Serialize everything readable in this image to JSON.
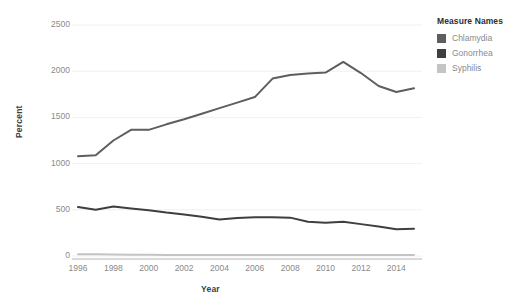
{
  "chart_data": {
    "type": "line",
    "title": "",
    "xlabel": "Year",
    "ylabel": "Percent",
    "xlim": [
      1996,
      2015
    ],
    "ylim": [
      0,
      2500
    ],
    "grid": true,
    "legend_position": "right",
    "legend_title": "Measure Names",
    "x": [
      1996,
      1997,
      1998,
      1999,
      2000,
      2001,
      2002,
      2003,
      2004,
      2005,
      2006,
      2007,
      2008,
      2009,
      2010,
      2011,
      2012,
      2013,
      2014,
      2015
    ],
    "xtick_labels": [
      "1996",
      "1998",
      "2000",
      "2002",
      "2004",
      "2006",
      "2008",
      "2010",
      "2012",
      "2014"
    ],
    "xticks": [
      1996,
      1998,
      2000,
      2002,
      2004,
      2006,
      2008,
      2010,
      2012,
      2014
    ],
    "ytick_labels": [
      "0",
      "500",
      "1000",
      "1500",
      "2000",
      "2500"
    ],
    "yticks": [
      0,
      500,
      1000,
      1500,
      2000,
      2500
    ],
    "series": [
      {
        "name": "Chlamydia",
        "color": "#5e5e5e",
        "values": [
          1080,
          1090,
          1250,
          1365,
          1365,
          1425,
          1480,
          1540,
          1600,
          1660,
          1720,
          1920,
          1960,
          1975,
          1985,
          2100,
          1980,
          1840,
          1775,
          1815
        ]
      },
      {
        "name": "Gonorrhea",
        "color": "#3f3f3f",
        "values": [
          530,
          500,
          535,
          515,
          495,
          470,
          450,
          425,
          395,
          410,
          420,
          420,
          415,
          370,
          360,
          370,
          345,
          320,
          290,
          295
        ]
      },
      {
        "name": "Syphilis",
        "color": "#c4c4c4",
        "values": [
          20,
          18,
          16,
          14,
          13,
          12,
          12,
          12,
          12,
          12,
          12,
          12,
          12,
          12,
          11,
          11,
          11,
          11,
          11,
          11
        ]
      }
    ]
  },
  "legend": {
    "title": "Measure Names",
    "items": [
      {
        "label": "Chlamydia",
        "color": "#5e5e5e"
      },
      {
        "label": "Gonorrhea",
        "color": "#3f3f3f"
      },
      {
        "label": "Syphilis",
        "color": "#c4c4c4"
      }
    ]
  },
  "axes": {
    "x_title": "Year",
    "y_title": "Percent"
  },
  "colors": {
    "background": "#ffffff",
    "gridline": "#f0f0f0",
    "axis_line": "#b5b5b5",
    "tick_text": "#8a8a8a",
    "axis_title_text": "#3d3d3d"
  }
}
